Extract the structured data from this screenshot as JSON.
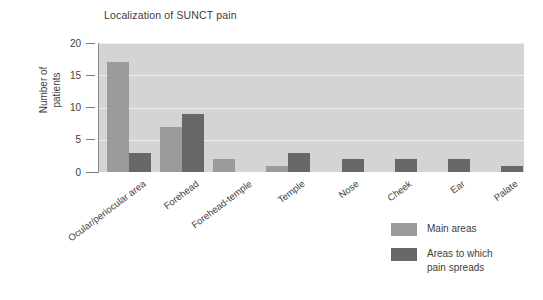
{
  "chart_data": {
    "type": "bar",
    "title": "Localization of SUNCT pain",
    "xlabel": "",
    "ylabel": "Number of\npatients",
    "ylabel_line1": "Number of",
    "ylabel_line2": "patients",
    "ylim": [
      0,
      20
    ],
    "yticks": [
      0,
      5,
      10,
      15,
      20
    ],
    "ytick_labels": [
      "0",
      "5",
      "10",
      "15",
      "20"
    ],
    "grid": true,
    "grid_color": "#efefef",
    "plot_background": "#d4d4d4",
    "legend_position": "bottom-right",
    "categories": [
      "Ocular/periocular area",
      "Forehead",
      "Forehead-temple",
      "Temple",
      "Nose",
      "Cheek",
      "Ear",
      "Palate"
    ],
    "series": [
      {
        "name": "Main areas",
        "color": "#9b9b9b",
        "values": [
          17,
          7,
          2,
          1,
          0,
          0,
          0,
          0
        ]
      },
      {
        "name": "Areas to which pain spreads",
        "color": "#686868",
        "values": [
          3,
          9,
          0,
          3,
          2,
          2,
          2,
          1
        ]
      }
    ]
  },
  "legend": {
    "items": [
      {
        "label": "Main areas",
        "swatch": "main"
      },
      {
        "label": "Areas to which\npain spreads",
        "swatch": "spread"
      }
    ],
    "item0_label": "Main areas",
    "item1_label": "Areas to which\npain spreads"
  }
}
